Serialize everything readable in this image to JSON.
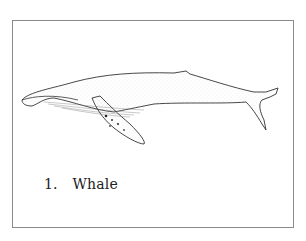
{
  "figure": {
    "illustration": "humpback-whale-line-drawing",
    "caption": {
      "number": "1.",
      "label": "Whale"
    }
  }
}
